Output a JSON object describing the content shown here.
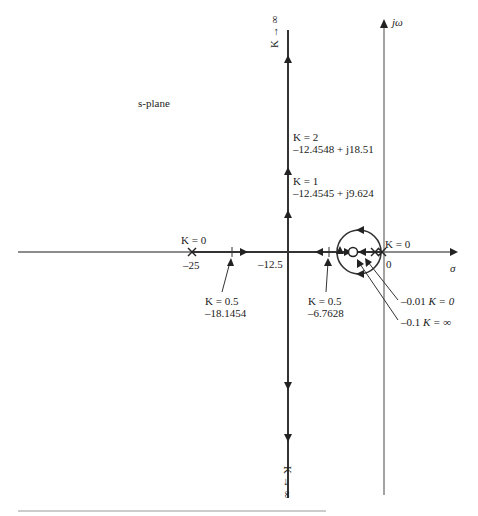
{
  "diagram": {
    "type": "root-locus",
    "plane_label": "s-plane",
    "axes": {
      "real_axis_label": "σ",
      "imag_axis_label": "jω",
      "origin_label": "0"
    },
    "poles": [
      {
        "value": "-25",
        "gain": "K = 0"
      },
      {
        "value": "0",
        "gain": "K = 0"
      },
      {
        "value": "-0.01",
        "gain": "K = 0"
      }
    ],
    "zeros": [
      {
        "value": "-0.1",
        "gain": "K = ∞"
      }
    ],
    "annotations": {
      "k0_left": "K = 0",
      "minus25": "–25",
      "minus12_5": "–12.5",
      "k0_right": "K = 0",
      "k_half_left_gain": "K = 0.5",
      "k_half_left_value": "–18.1454",
      "k_half_right_gain": "K = 0.5",
      "k_half_right_value": "–6.7628",
      "k2_gain": "K = 2",
      "k2_value": "–12.4548 + j18.51",
      "k1_gain": "K = 1",
      "k1_value": "–12.4545 + j9.624",
      "pole_001": "–0.01",
      "pole_001_gain": "K = 0",
      "zero_01": "–0.1",
      "zero_01_gain": "K = ∞",
      "k_inf_top": "K → ∞",
      "k_inf_bottom": "K → ∞"
    },
    "asymptote_real_part": "-12.5"
  }
}
